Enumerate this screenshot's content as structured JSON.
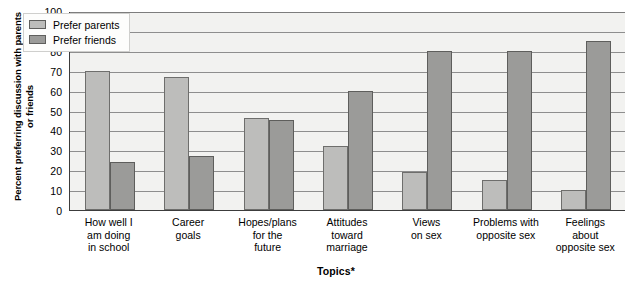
{
  "chart_data": {
    "type": "bar",
    "title": "",
    "xlabel": "Topics*",
    "ylabel": "Percent preferring discussion with parents or friends",
    "ylim": [
      0,
      100
    ],
    "ytick_step": 10,
    "yticks": [
      100,
      90,
      80,
      70,
      60,
      50,
      40,
      30,
      20,
      10,
      0
    ],
    "grid": true,
    "legend_position": "top-left",
    "categories": [
      "How well I am doing in school",
      "Career goals",
      "Hopes/plans for the future",
      "Attitudes toward marriage",
      "Views on sex",
      "Problems with opposite sex",
      "Feelings about opposite sex"
    ],
    "category_lines": [
      [
        "How well I",
        "am doing",
        "in school"
      ],
      [
        "Career",
        "goals"
      ],
      [
        "Hopes/plans",
        "for the",
        "future"
      ],
      [
        "Attitudes",
        "toward",
        "marriage"
      ],
      [
        "Views",
        "on sex"
      ],
      [
        "Problems with",
        "opposite sex"
      ],
      [
        "Feelings",
        "about",
        "opposite sex"
      ]
    ],
    "series": [
      {
        "name": "Prefer parents",
        "color": "#bdbdbb",
        "values": [
          70,
          67,
          46,
          32,
          19,
          15,
          10
        ]
      },
      {
        "name": "Prefer friends",
        "color": "#9b9b99",
        "values": [
          24,
          27,
          45,
          60,
          80,
          80,
          85
        ]
      }
    ]
  },
  "legend": {
    "items": [
      {
        "label": "Prefer parents",
        "swatch": "parents"
      },
      {
        "label": "Prefer friends",
        "swatch": "friends"
      }
    ]
  },
  "axes": {
    "y_title": "Percent preferring discussion with parents or friends",
    "x_title": "Topics*"
  },
  "colors": {
    "parents_fill": "#bdbdbb",
    "friends_fill": "#9b9b99",
    "plot_background": "#f2f2f0",
    "gridline": "#8e8e8e",
    "axis": "#3c3c3c"
  }
}
